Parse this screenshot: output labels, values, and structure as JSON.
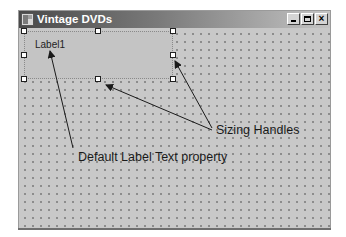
{
  "window": {
    "title": "Vintage DVDs",
    "icon": "form-icon",
    "buttons": [
      {
        "name": "minimize",
        "icon": "minimize-icon"
      },
      {
        "name": "maximize",
        "icon": "maximize-icon"
      },
      {
        "name": "close",
        "icon": "close-icon",
        "glyph": "×"
      }
    ]
  },
  "form": {
    "label_control": {
      "text": "Label1",
      "selected": true,
      "handles": [
        "top-left",
        "top-middle",
        "top-right",
        "middle-left",
        "middle-right",
        "bottom-left",
        "bottom-middle",
        "bottom-right"
      ]
    }
  },
  "annotations": {
    "sizing_handles": "Sizing Handles",
    "default_label_text": "Default Label Text property"
  },
  "colors": {
    "form_background": "#c8c8c8",
    "grid_dot": "#8a8a8a",
    "titlebar_start": "#4a4a4a",
    "titlebar_end": "#c4c4c4",
    "arrow": "#1a1a1a"
  }
}
